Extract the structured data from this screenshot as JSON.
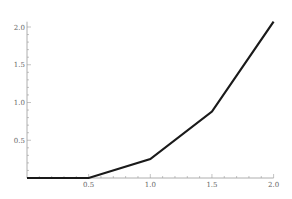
{
  "chart_data": {
    "type": "line",
    "title": "",
    "xlabel": "",
    "ylabel": "",
    "x": [
      0,
      0.5,
      1.0,
      1.5,
      2.0
    ],
    "series": [
      {
        "name": "f(x)",
        "values": [
          0,
          0,
          0.25,
          0.88,
          2.07
        ],
        "color": "#1a1a1a"
      }
    ],
    "xlim": [
      0,
      2.0
    ],
    "ylim": [
      0,
      2.07
    ],
    "x_ticks": [
      0.5,
      1.0,
      1.5,
      2.0
    ],
    "x_tick_labels": [
      "0.5",
      "1.0",
      "1.5",
      "2.0"
    ],
    "y_ticks": [
      0.5,
      1.0,
      1.5,
      2.0
    ],
    "y_tick_labels": [
      "0.5",
      "1.0",
      "1.5",
      "2.0"
    ],
    "minor_tick_step": 0.1,
    "grid": false,
    "legend": "none"
  }
}
